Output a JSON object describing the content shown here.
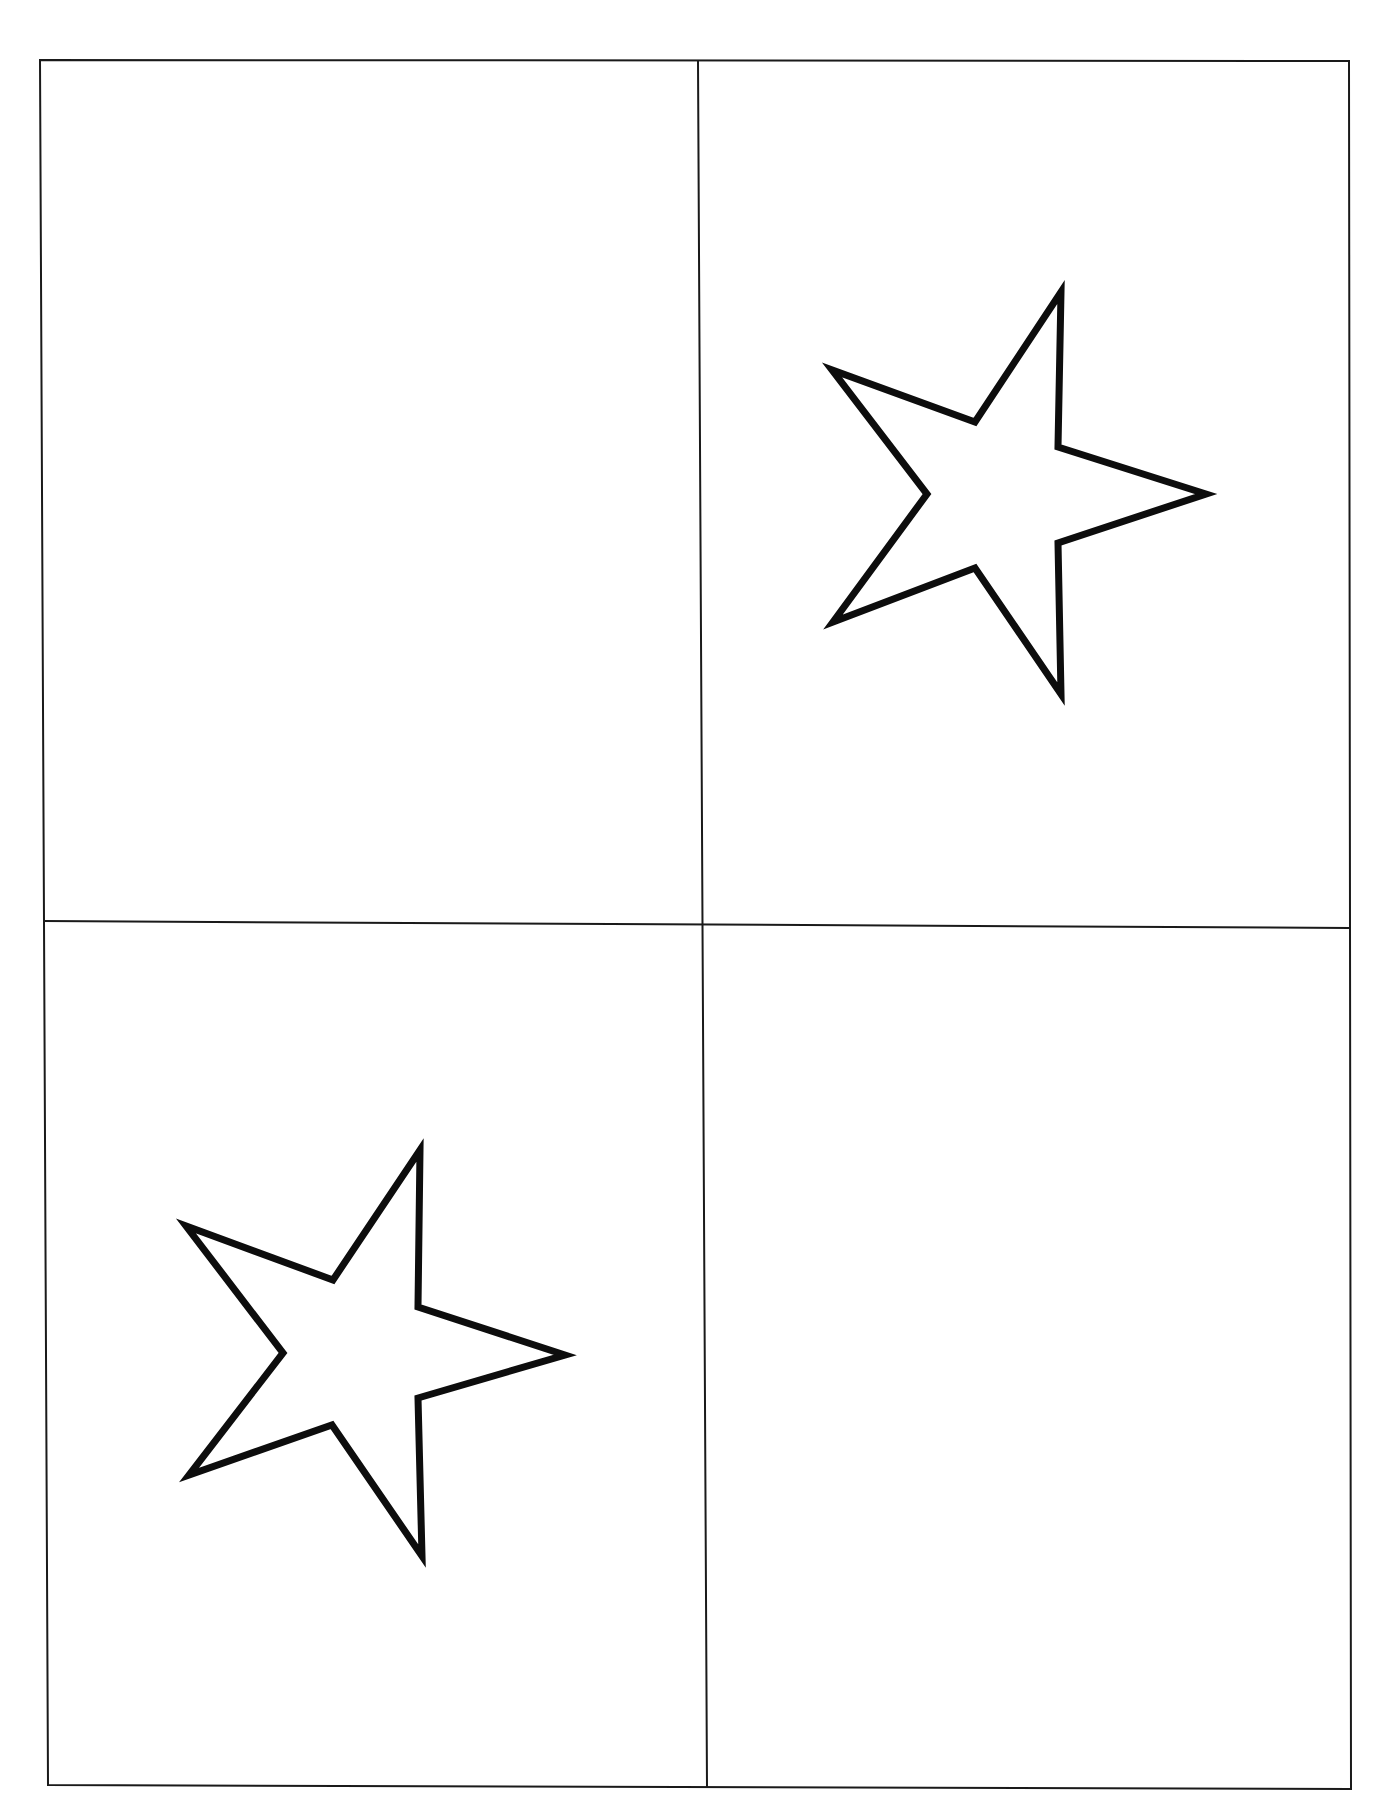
{
  "document": {
    "description": "Worksheet page divided into four quadrants; two quadrants contain outlined five-pointed stars",
    "colors": {
      "background": "#ffffff",
      "line": "#1a1a1a",
      "star_outline": "#0d0d0d",
      "star_fill": "#ffffff"
    },
    "frame": {
      "outer": {
        "top_left": [
          40,
          60
        ],
        "top_right": [
          1349,
          61
        ],
        "bottom_right": [
          1351,
          1789
        ],
        "bottom_left": [
          48,
          1785
        ]
      },
      "vertical_divider": {
        "top": [
          698,
          61
        ],
        "bottom": [
          707,
          1787
        ]
      },
      "horizontal_divider": {
        "left": [
          44,
          921
        ],
        "right": [
          1349,
          928
        ]
      }
    },
    "quadrants": [
      {
        "position": "top-left",
        "label": "Quadrant 1 (top-left): empty",
        "contains_star": false
      },
      {
        "position": "top-right",
        "label": "Quadrant 2 (top-right): star",
        "contains_star": true
      },
      {
        "position": "bottom-left",
        "label": "Quadrant 3 (bottom-left): star",
        "contains_star": true
      },
      {
        "position": "bottom-right",
        "label": "Quadrant 4 (bottom-right): empty",
        "contains_star": false
      }
    ],
    "stars": [
      {
        "quadrant": "top-right",
        "icon": "star-outline-icon",
        "points": "1061,292 1058,447 1206,494 1058,543 1061,694 975,568 833,622 927,494 832,370 975,422"
      },
      {
        "quadrant": "bottom-left",
        "icon": "star-outline-icon",
        "points": "420,1150 418,1307 565,1355 418,1398 422,1556 332,1425 189,1475 283,1353 186,1226 333,1280"
      }
    ]
  }
}
